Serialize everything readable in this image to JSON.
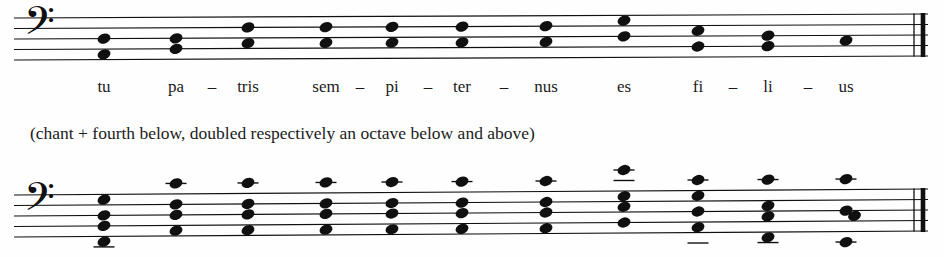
{
  "page": {
    "width": 944,
    "height": 257,
    "background_color": "#fefefe",
    "ink_color": "#101010"
  },
  "caption": {
    "text": "(chant + fourth below, doubled respectively an octave below and above)"
  },
  "lyrics": {
    "syllables": [
      {
        "text": "tu",
        "x": 104
      },
      {
        "text": "pa",
        "x": 176
      },
      {
        "text": "tris",
        "x": 248
      },
      {
        "text": "sem",
        "x": 326
      },
      {
        "text": "pi",
        "x": 392
      },
      {
        "text": "ter",
        "x": 462
      },
      {
        "text": "nus",
        "x": 546
      },
      {
        "text": "es",
        "x": 624
      },
      {
        "text": "fi",
        "x": 698
      },
      {
        "text": "li",
        "x": 768
      },
      {
        "text": "us",
        "x": 846
      }
    ],
    "hyphens": [
      {
        "text": "–",
        "x": 212
      },
      {
        "text": "–",
        "x": 360
      },
      {
        "text": "–",
        "x": 428
      },
      {
        "text": "–",
        "x": 504
      },
      {
        "text": "–",
        "x": 733
      },
      {
        "text": "–",
        "x": 808
      }
    ]
  },
  "staff_1": {
    "name": "upper-system",
    "clef": "bass-clef",
    "clef_symbol": "𝄢",
    "staff_left": 14,
    "staff_right": 928,
    "line_spacing": 10.5,
    "top_line_y_left": 18,
    "top_line_y_right": 14,
    "line_count": 5,
    "final_barline": {
      "type": "light-heavy",
      "x": 914
    },
    "chords": [
      {
        "x": 104,
        "notes": [
          2.0,
          3.5
        ]
      },
      {
        "x": 176,
        "notes": [
          2.0,
          3.0
        ]
      },
      {
        "x": 248,
        "notes": [
          1.0,
          2.5
        ]
      },
      {
        "x": 326,
        "notes": [
          1.0,
          2.5
        ]
      },
      {
        "x": 392,
        "notes": [
          1.0,
          2.5
        ]
      },
      {
        "x": 462,
        "notes": [
          1.0,
          2.5
        ]
      },
      {
        "x": 546,
        "notes": [
          1.0,
          2.5
        ]
      },
      {
        "x": 624,
        "notes": [
          0.5,
          2.0
        ]
      },
      {
        "x": 698,
        "notes": [
          1.5,
          3.0
        ]
      },
      {
        "x": 768,
        "notes": [
          2.0,
          3.0
        ]
      },
      {
        "x": 846,
        "notes": [
          2.5
        ]
      }
    ]
  },
  "staff_2": {
    "name": "lower-system",
    "clef": "bass-clef",
    "clef_symbol": "𝄢",
    "staff_left": 14,
    "staff_right": 928,
    "line_spacing": 10.5,
    "top_line_y_left": 40,
    "top_line_y_right": 34,
    "line_count": 5,
    "final_barline": {
      "type": "light-heavy",
      "x": 914
    },
    "chords": [
      {
        "x": 104,
        "notes": [
          0.5,
          2.0,
          3.0,
          4.5
        ],
        "ledgers_below": 1
      },
      {
        "x": 176,
        "notes": [
          -1.0,
          1.0,
          2.0,
          3.5
        ],
        "ledgers_above": 1
      },
      {
        "x": 248,
        "notes": [
          -1.0,
          1.0,
          2.0,
          3.5
        ],
        "ledgers_above": 1
      },
      {
        "x": 326,
        "notes": [
          -1.0,
          1.0,
          2.0,
          3.5
        ],
        "ledgers_above": 1
      },
      {
        "x": 392,
        "notes": [
          -1.0,
          1.0,
          2.0,
          3.5
        ],
        "ledgers_above": 1
      },
      {
        "x": 462,
        "notes": [
          -1.0,
          1.0,
          2.0,
          3.5
        ],
        "ledgers_above": 1
      },
      {
        "x": 546,
        "notes": [
          -1.0,
          1.0,
          2.0,
          3.5
        ],
        "ledgers_above": 1
      },
      {
        "x": 624,
        "notes": [
          -2.0,
          0.5,
          1.5,
          3.0
        ],
        "ledgers_above": 2
      },
      {
        "x": 698,
        "notes": [
          -1.0,
          0.5,
          2.0,
          3.5
        ],
        "ledgers_above": 1,
        "ledgers_below": 1
      },
      {
        "x": 768,
        "notes": [
          -1.0,
          1.5,
          2.5,
          4.5
        ],
        "ledgers_above": 1,
        "ledgers_below": 1
      },
      {
        "x": 846,
        "notes": [
          -1.0,
          2.0,
          2.5,
          5.0
        ],
        "ledgers_above": 1,
        "ledgers_below": 1,
        "seconds_offset": true
      }
    ]
  }
}
